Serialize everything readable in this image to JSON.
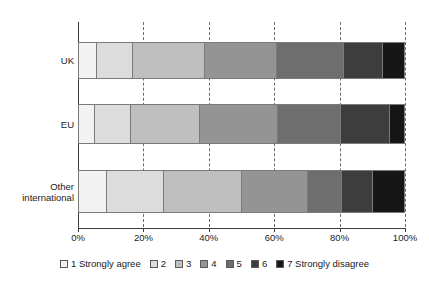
{
  "chart_data": {
    "type": "bar",
    "orientation": "horizontal",
    "stacked": true,
    "title": "",
    "subtitle": "",
    "xlabel": "",
    "ylabel": "",
    "xlim": [
      0,
      100
    ],
    "grid": true,
    "legend_position": "bottom",
    "categories": [
      "UK",
      "EU",
      "Other international"
    ],
    "x_tick_labels": [
      "0%",
      "20%",
      "40%",
      "60%",
      "80%",
      "100%"
    ],
    "x_tick_values": [
      0,
      20,
      40,
      60,
      80,
      100
    ],
    "series": [
      {
        "name": "1 Strongly agree",
        "color": "#f2f2f2",
        "values": [
          5.5,
          5.0,
          8.5
        ]
      },
      {
        "name": "2",
        "color": "#dcdcdc",
        "color_hex": "#dcdcdc",
        "values": [
          11.0,
          11.0,
          17.5
        ]
      },
      {
        "name": "3",
        "color": "#bfbfbf",
        "values": [
          22.0,
          21.0,
          24.0
        ]
      },
      {
        "name": "4",
        "color": "#949494",
        "values": [
          22.0,
          24.0,
          20.0
        ]
      },
      {
        "name": "5",
        "color": "#6e6e6e",
        "values": [
          20.5,
          19.0,
          10.5
        ]
      },
      {
        "name": "6",
        "color": "#3d3d3d",
        "values": [
          12.0,
          15.0,
          9.5
        ]
      },
      {
        "name": "7 Strongly disagree",
        "color": "#161616",
        "values": [
          7.0,
          5.0,
          10.0
        ]
      }
    ]
  },
  "axis": {
    "y_categories": [
      {
        "label": "UK",
        "line1": "UK",
        "line2": ""
      },
      {
        "label": "EU",
        "line1": "EU",
        "line2": ""
      },
      {
        "label": "Other international",
        "line1": "Other",
        "line2": "international"
      }
    ],
    "x_ticks": [
      {
        "label": "0%",
        "value": 0
      },
      {
        "label": "20%",
        "value": 20
      },
      {
        "label": "40%",
        "value": 40
      },
      {
        "label": "60%",
        "value": 60
      },
      {
        "label": "80%",
        "value": 80
      },
      {
        "label": "100%",
        "value": 100
      }
    ]
  },
  "legend": {
    "items": [
      {
        "label": "1 Strongly agree",
        "color": "#f2f2f2"
      },
      {
        "label": "2",
        "color": "#dcdcdc"
      },
      {
        "label": "3",
        "color": "#bfbfbf"
      },
      {
        "label": "4",
        "color": "#949494"
      },
      {
        "label": "5",
        "color": "#6e6e6e"
      },
      {
        "label": "6",
        "color": "#3d3d3d"
      },
      {
        "label": "7 Strongly disagree",
        "color": "#161616"
      }
    ]
  },
  "style": {
    "background": "#ffffff",
    "axis_color": "#3c3c3c",
    "gridline_color": "#6a6a6a",
    "segment_border": "#7a7a7a",
    "text_color": "#1a1a1a"
  }
}
